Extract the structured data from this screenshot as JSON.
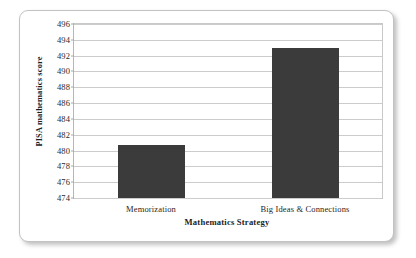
{
  "chart_data": {
    "type": "bar",
    "title": "",
    "xlabel": "Mathematics Strategy",
    "ylabel": "PISA mathematics score",
    "categories": [
      "Memorization",
      "Big Ideas & Connections"
    ],
    "values": [
      480.7,
      493.0
    ],
    "ylim": [
      474,
      496
    ],
    "ytick_step": 2,
    "yticks": [
      496,
      494,
      492,
      490,
      488,
      486,
      484,
      482,
      480,
      478,
      476,
      474
    ],
    "ytick_labels": [
      "496",
      "494",
      "492",
      "490",
      "488",
      "486",
      "484",
      "482",
      "480",
      "478",
      "476",
      "474"
    ],
    "grid": true,
    "legend": false,
    "legend_position": "none",
    "bar_color": "#3b3b3b",
    "gridline_color": "#cccccc",
    "plot_border_color": "#b6b6b6",
    "background_color": "#ffffff",
    "frame_border_color": "#c2c2c2"
  }
}
